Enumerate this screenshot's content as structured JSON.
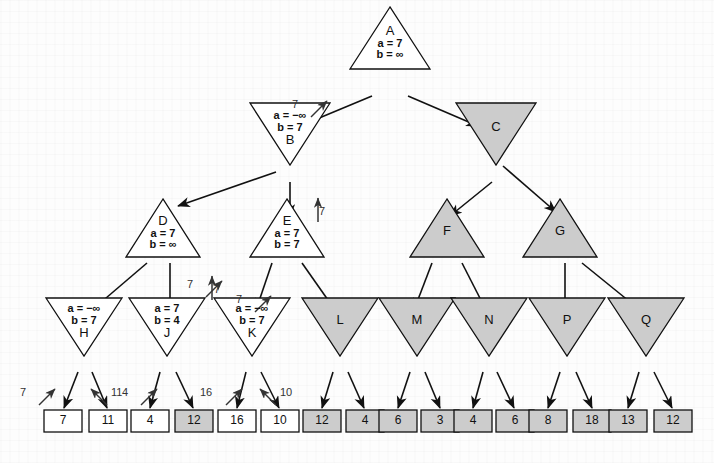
{
  "figure": {
    "colors": {
      "pruned_fill": "#cccccc",
      "active_fill": "#ffffff",
      "stroke": "#111111",
      "background": "#fdfdfd"
    }
  },
  "nodes": [
    {
      "id": "A",
      "letter": "A",
      "alpha": "a = 7",
      "beta": "b = ∞",
      "shape": "max",
      "pruned": false,
      "cx": 390,
      "cy": 38,
      "w": 80,
      "h": 62
    },
    {
      "id": "B",
      "letter": "B",
      "alpha": "a = −∞",
      "beta": "b = 7",
      "shape": "min",
      "pruned": false,
      "cx": 290,
      "cy": 134,
      "w": 80,
      "h": 62
    },
    {
      "id": "C",
      "letter": "C",
      "alpha": "",
      "beta": "",
      "shape": "min",
      "pruned": true,
      "cx": 496,
      "cy": 134,
      "w": 80,
      "h": 62
    },
    {
      "id": "D",
      "letter": "D",
      "alpha": "a = 7",
      "beta": "b = ∞",
      "shape": "max",
      "pruned": false,
      "cx": 163,
      "cy": 228,
      "w": 74,
      "h": 58
    },
    {
      "id": "E",
      "letter": "E",
      "alpha": "a = 7",
      "beta": "b = 7",
      "shape": "max",
      "pruned": false,
      "cx": 287,
      "cy": 228,
      "w": 74,
      "h": 58
    },
    {
      "id": "F",
      "letter": "F",
      "alpha": "",
      "beta": "",
      "shape": "max",
      "pruned": true,
      "cx": 447,
      "cy": 228,
      "w": 74,
      "h": 58
    },
    {
      "id": "G",
      "letter": "G",
      "alpha": "",
      "beta": "",
      "shape": "max",
      "pruned": true,
      "cx": 560,
      "cy": 228,
      "w": 74,
      "h": 58
    },
    {
      "id": "H",
      "letter": "H",
      "alpha": "a = −∞",
      "beta": "b = 7",
      "shape": "min",
      "pruned": false,
      "cx": 84,
      "cy": 327,
      "w": 76,
      "h": 58
    },
    {
      "id": "J",
      "letter": "J",
      "alpha": "a = 7",
      "beta": "b = 4",
      "shape": "min",
      "pruned": false,
      "cx": 167,
      "cy": 327,
      "w": 76,
      "h": 58
    },
    {
      "id": "K",
      "letter": "K",
      "alpha": "a = −∞",
      "beta": "b = 7",
      "shape": "min",
      "pruned": false,
      "cx": 252,
      "cy": 327,
      "w": 76,
      "h": 58
    },
    {
      "id": "L",
      "letter": "L",
      "alpha": "",
      "beta": "",
      "shape": "min",
      "pruned": true,
      "cx": 340,
      "cy": 327,
      "w": 76,
      "h": 58
    },
    {
      "id": "M",
      "letter": "M",
      "alpha": "",
      "beta": "",
      "shape": "min",
      "pruned": true,
      "cx": 417,
      "cy": 327,
      "w": 76,
      "h": 58
    },
    {
      "id": "N",
      "letter": "N",
      "alpha": "",
      "beta": "",
      "shape": "min",
      "pruned": true,
      "cx": 489,
      "cy": 327,
      "w": 76,
      "h": 58
    },
    {
      "id": "P",
      "letter": "P",
      "alpha": "",
      "beta": "",
      "shape": "min",
      "pruned": true,
      "cx": 567,
      "cy": 327,
      "w": 76,
      "h": 58
    },
    {
      "id": "Q",
      "letter": "Q",
      "alpha": "",
      "beta": "",
      "shape": "min",
      "pruned": true,
      "cx": 646,
      "cy": 327,
      "w": 76,
      "h": 58
    }
  ],
  "leaves": [
    {
      "value": "7",
      "pruned": false,
      "cx": 63,
      "cy": 421
    },
    {
      "value": "11",
      "pruned": false,
      "cx": 108,
      "cy": 421
    },
    {
      "value": "4",
      "pruned": false,
      "cx": 150,
      "cy": 421
    },
    {
      "value": "12",
      "pruned": true,
      "cx": 194,
      "cy": 421
    },
    {
      "value": "16",
      "pruned": false,
      "cx": 237,
      "cy": 421
    },
    {
      "value": "10",
      "pruned": false,
      "cx": 280,
      "cy": 421
    },
    {
      "value": "12",
      "pruned": true,
      "cx": 322,
      "cy": 421
    },
    {
      "value": "4",
      "pruned": true,
      "cx": 365,
      "cy": 421
    },
    {
      "value": "6",
      "pruned": true,
      "cx": 398,
      "cy": 421
    },
    {
      "value": "3",
      "pruned": true,
      "cx": 440,
      "cy": 421
    },
    {
      "value": "4",
      "pruned": true,
      "cx": 473,
      "cy": 421
    },
    {
      "value": "6",
      "pruned": true,
      "cx": 515,
      "cy": 421
    },
    {
      "value": "8",
      "pruned": true,
      "cx": 548,
      "cy": 421
    },
    {
      "value": "18",
      "pruned": true,
      "cx": 592,
      "cy": 421
    },
    {
      "value": "13",
      "pruned": true,
      "cx": 628,
      "cy": 421
    },
    {
      "value": "12",
      "pruned": true,
      "cx": 673,
      "cy": 421
    }
  ],
  "edges": [
    {
      "from": "A",
      "to": "B",
      "x1": 372,
      "y1": 96,
      "x2": 300,
      "y2": 126
    },
    {
      "from": "A",
      "to": "C",
      "x1": 408,
      "y1": 96,
      "x2": 478,
      "y2": 126
    },
    {
      "from": "B",
      "to": "D",
      "x1": 276,
      "y1": 172,
      "x2": 178,
      "y2": 206
    },
    {
      "from": "B",
      "to": "E",
      "x1": 290,
      "y1": 182,
      "x2": 290,
      "y2": 216
    },
    {
      "from": "C",
      "to": "F",
      "x1": 492,
      "y1": 182,
      "x2": 450,
      "y2": 216
    },
    {
      "from": "C",
      "to": "G",
      "x1": 503,
      "y1": 166,
      "x2": 556,
      "y2": 212
    },
    {
      "from": "D",
      "to": "H",
      "x1": 147,
      "y1": 263,
      "x2": 92,
      "y2": 310
    },
    {
      "from": "D",
      "to": "J",
      "x1": 170,
      "y1": 263,
      "x2": 170,
      "y2": 310
    },
    {
      "from": "E",
      "to": "K",
      "x1": 272,
      "y1": 263,
      "x2": 256,
      "y2": 310
    },
    {
      "from": "E",
      "to": "L",
      "x1": 302,
      "y1": 263,
      "x2": 335,
      "y2": 310
    },
    {
      "from": "F",
      "to": "M",
      "x1": 432,
      "y1": 263,
      "x2": 414,
      "y2": 310
    },
    {
      "from": "F",
      "to": "N",
      "x1": 462,
      "y1": 263,
      "x2": 486,
      "y2": 310
    },
    {
      "from": "G",
      "to": "P",
      "x1": 565,
      "y1": 263,
      "x2": 565,
      "y2": 310
    },
    {
      "from": "G",
      "to": "Q",
      "x1": 582,
      "y1": 263,
      "x2": 640,
      "y2": 310
    },
    {
      "from": "H",
      "to": "l1",
      "x1": 78,
      "y1": 372,
      "x2": 64,
      "y2": 408
    },
    {
      "from": "H",
      "to": "l2",
      "x1": 92,
      "y1": 372,
      "x2": 107,
      "y2": 408
    },
    {
      "from": "J",
      "to": "l3",
      "x1": 160,
      "y1": 372,
      "x2": 150,
      "y2": 408
    },
    {
      "from": "J",
      "to": "l4",
      "x1": 176,
      "y1": 372,
      "x2": 193,
      "y2": 408
    },
    {
      "from": "K",
      "to": "l5",
      "x1": 246,
      "y1": 372,
      "x2": 237,
      "y2": 408
    },
    {
      "from": "K",
      "to": "l6",
      "x1": 261,
      "y1": 372,
      "x2": 279,
      "y2": 408
    },
    {
      "from": "L",
      "to": "l7",
      "x1": 333,
      "y1": 372,
      "x2": 322,
      "y2": 408
    },
    {
      "from": "L",
      "to": "l8",
      "x1": 348,
      "y1": 372,
      "x2": 364,
      "y2": 408
    },
    {
      "from": "M",
      "to": "l9",
      "x1": 410,
      "y1": 372,
      "x2": 398,
      "y2": 408
    },
    {
      "from": "M",
      "to": "l10",
      "x1": 425,
      "y1": 372,
      "x2": 440,
      "y2": 408
    },
    {
      "from": "N",
      "to": "l11",
      "x1": 483,
      "y1": 372,
      "x2": 473,
      "y2": 408
    },
    {
      "from": "N",
      "to": "l12",
      "x1": 497,
      "y1": 372,
      "x2": 514,
      "y2": 408
    },
    {
      "from": "P",
      "to": "l13",
      "x1": 560,
      "y1": 372,
      "x2": 548,
      "y2": 408
    },
    {
      "from": "P",
      "to": "l14",
      "x1": 576,
      "y1": 372,
      "x2": 592,
      "y2": 408
    },
    {
      "from": "Q",
      "to": "l15",
      "x1": 639,
      "y1": 372,
      "x2": 628,
      "y2": 408
    },
    {
      "from": "Q",
      "to": "l16",
      "x1": 654,
      "y1": 372,
      "x2": 672,
      "y2": 408
    }
  ],
  "return_arrows": [
    {
      "label": "7",
      "label_x": 292,
      "label_y": 98,
      "ax1": 311,
      "ay1": 117,
      "ax2": 327,
      "ay2": 101
    },
    {
      "label": "7",
      "label_x": 187,
      "label_y": 278,
      "ax1": 206,
      "ay1": 297,
      "ax2": 222,
      "ay2": 281
    },
    {
      "label": "7",
      "label_x": 319,
      "label_y": 205,
      "ax1": 318,
      "ay1": 222,
      "ax2": 318,
      "ay2": 198
    },
    {
      "label": "7",
      "label_x": 214,
      "label_y": 283,
      "ax1": 212,
      "ay1": 300,
      "ax2": 212,
      "ay2": 276
    },
    {
      "label": "7",
      "label_x": 236,
      "label_y": 293,
      "ax1": 255,
      "ay1": 312,
      "ax2": 271,
      "ay2": 296
    },
    {
      "label": "7",
      "label_x": 20,
      "label_y": 386,
      "ax1": 39,
      "ay1": 405,
      "ax2": 55,
      "ay2": 389
    },
    {
      "label": "11",
      "label_x": 111,
      "label_y": 386,
      "ax1": 107,
      "ay1": 405,
      "ax2": 91,
      "ay2": 389
    },
    {
      "label": "4",
      "label_x": 122,
      "label_y": 386,
      "ax1": 141,
      "ay1": 405,
      "ax2": 157,
      "ay2": 389
    },
    {
      "label": "16",
      "label_x": 200,
      "label_y": 386,
      "ax1": 226,
      "ay1": 405,
      "ax2": 242,
      "ay2": 389
    },
    {
      "label": "10",
      "label_x": 280,
      "label_y": 386,
      "ax1": 276,
      "ay1": 405,
      "ax2": 260,
      "ay2": 389
    }
  ]
}
